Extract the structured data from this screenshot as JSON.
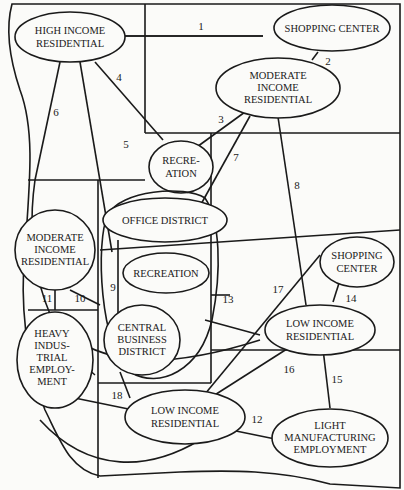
{
  "diagram": {
    "type": "urban land-use linkage map",
    "colors": {
      "ink": "#1a1a1a",
      "paper": "#fbfbf9"
    },
    "nodes": [
      {
        "id": "high_income_res",
        "lines": [
          "HIGH INCOME",
          "RESIDENTIAL"
        ]
      },
      {
        "id": "shopping_center_top",
        "lines": [
          "SHOPPING CENTER"
        ]
      },
      {
        "id": "moderate_income_res_top",
        "lines": [
          "MODERATE",
          "INCOME",
          "RESIDENTIAL"
        ]
      },
      {
        "id": "recreation_top",
        "lines": [
          "RECRE-",
          "ATION"
        ]
      },
      {
        "id": "office_district",
        "lines": [
          "OFFICE DISTRICT"
        ]
      },
      {
        "id": "moderate_income_res_left",
        "lines": [
          "MODERATE",
          "INCOME",
          "RESIDENTIAL"
        ]
      },
      {
        "id": "recreation_center",
        "lines": [
          "RECREATION"
        ]
      },
      {
        "id": "central_business_district",
        "lines": [
          "CENTRAL",
          "BUSINESS",
          "DISTRICT"
        ]
      },
      {
        "id": "shopping_center_right",
        "lines": [
          "SHOPPING",
          "CENTER"
        ]
      },
      {
        "id": "low_income_res_right",
        "lines": [
          "LOW INCOME",
          "RESIDENTIAL"
        ]
      },
      {
        "id": "heavy_industrial",
        "lines": [
          "HEAVY",
          "INDUS-",
          "TRIAL",
          "EMPLOY-",
          "MENT"
        ]
      },
      {
        "id": "low_income_res_bottom",
        "lines": [
          "LOW INCOME",
          "RESIDENTIAL"
        ]
      },
      {
        "id": "light_manufacturing",
        "lines": [
          "LIGHT",
          "MANUFACTURING",
          "EMPLOYMENT"
        ]
      }
    ],
    "links": [
      {
        "label": "1",
        "from": "high_income_res",
        "to": "shopping_center_top"
      },
      {
        "label": "2",
        "from": "shopping_center_top",
        "to": "moderate_income_res_top"
      },
      {
        "label": "3",
        "from": "moderate_income_res_top",
        "to": "recreation_top"
      },
      {
        "label": "4",
        "from": "high_income_res",
        "to": "recreation_top"
      },
      {
        "label": "5",
        "from": "high_income_res",
        "to": "office_district"
      },
      {
        "label": "6",
        "from": "high_income_res",
        "to": "central_business_district"
      },
      {
        "label": "7",
        "from": "moderate_income_res_top",
        "to": "office_district"
      },
      {
        "label": "8",
        "from": "moderate_income_res_top",
        "to": "low_income_res_right"
      },
      {
        "label": "9",
        "from": "office_district",
        "to": "central_business_district"
      },
      {
        "label": "10",
        "from": "moderate_income_res_left",
        "to": "central_business_district"
      },
      {
        "label": "11",
        "from": "moderate_income_res_left",
        "to": "heavy_industrial"
      },
      {
        "label": "12",
        "from": "heavy_industrial",
        "to": "light_manufacturing"
      },
      {
        "label": "13",
        "from": "central_business_district",
        "to": "low_income_res_right"
      },
      {
        "label": "14",
        "from": "shopping_center_right",
        "to": "low_income_res_right"
      },
      {
        "label": "15",
        "from": "low_income_res_right",
        "to": "light_manufacturing"
      },
      {
        "label": "16",
        "from": "low_income_res_right",
        "to": "low_income_res_bottom"
      },
      {
        "label": "17",
        "from": "shopping_center_right",
        "to": "low_income_res_bottom"
      },
      {
        "label": "18",
        "from": "central_business_district",
        "to": "low_income_res_bottom"
      }
    ]
  }
}
